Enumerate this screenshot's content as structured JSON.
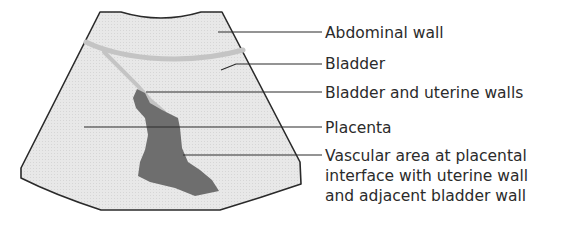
{
  "diagram": {
    "type": "labeled ultrasound schematic",
    "colors": {
      "fan_fill": "#e6e6e6",
      "fan_stroke": "#2a2a2a",
      "bladder_wall": "#c2c2c2",
      "vascular_area": "#6e6e6e",
      "leader_line": "#2a2a2a",
      "text": "#2b2b2b"
    },
    "labels": [
      {
        "id": "abdominal-wall",
        "text": "Abdominal wall",
        "y": 24
      },
      {
        "id": "bladder",
        "text": "Bladder",
        "y": 55
      },
      {
        "id": "bladder-uterine-walls",
        "text": "Bladder and uterine walls",
        "y": 84
      },
      {
        "id": "placenta",
        "text": "Placenta",
        "y": 119
      },
      {
        "id": "vascular-area",
        "text": "Vascular area at placental",
        "y": 147
      },
      {
        "id": "vascular-area-2",
        "text": "interface with uterine wall",
        "y": 167
      },
      {
        "id": "vascular-area-3",
        "text": "and adjacent bladder wall",
        "y": 187
      }
    ]
  }
}
